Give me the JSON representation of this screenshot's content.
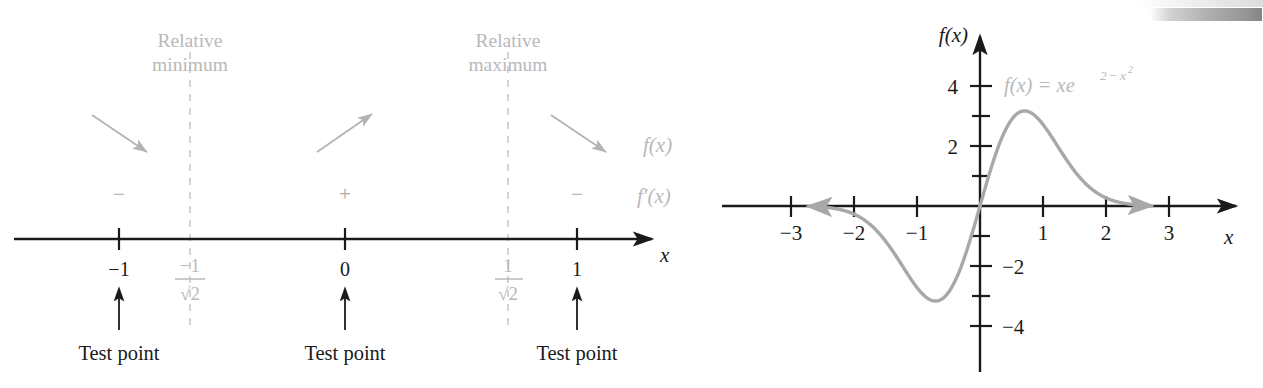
{
  "figure": {
    "kind": "calculus-textbook-figure",
    "panels": [
      "sign-chart-number-line",
      "function-graph"
    ]
  },
  "sign_chart": {
    "axis_label": "x",
    "row_labels": {
      "f": "f(x)",
      "fprime": "f′(x)"
    },
    "critical_labels": [
      {
        "id": "relative-minimum",
        "line1": "Relative",
        "line2": "minimum",
        "at": "-1/√2"
      },
      {
        "id": "relative-maximum",
        "line1": "Relative",
        "line2": "maximum",
        "at": "1/√2"
      }
    ],
    "ticks": [
      {
        "label": "−1",
        "kind": "test-point",
        "type": "plain"
      },
      {
        "label": "−1/√2",
        "numerator": "−1",
        "denominator": "√2",
        "kind": "critical",
        "type": "fraction"
      },
      {
        "label": "0",
        "kind": "test-point",
        "type": "plain"
      },
      {
        "label": "1/√2",
        "numerator": "1",
        "denominator": "√2",
        "kind": "critical",
        "type": "fraction"
      },
      {
        "label": "1",
        "kind": "test-point",
        "type": "plain"
      }
    ],
    "intervals": [
      {
        "sign": "−",
        "behavior": "decreasing",
        "arrow": "down-right"
      },
      {
        "sign": "+",
        "behavior": "increasing",
        "arrow": "up-right"
      },
      {
        "sign": "−",
        "behavior": "decreasing",
        "arrow": "down-right"
      }
    ],
    "test_point_caption": "Test point",
    "test_point_captions": [
      "Test point",
      "Test point",
      "Test point"
    ]
  },
  "graph": {
    "y_axis_label": "f(x)",
    "x_axis_label": "x",
    "equation": "f(x) = xe",
    "equation_exp_base": "2",
    "equation_exp_minus": "−",
    "equation_exp_var": "x",
    "equation_exp_pow": "2",
    "equation_plain": "f(x) = xe^(2−x²)",
    "x_tick_labels": [
      "−3",
      "−2",
      "−1",
      "1",
      "2",
      "3"
    ],
    "y_tick_labels": [
      "4",
      "2",
      "−2",
      "−4"
    ]
  },
  "colors": {
    "curve": "#a8a8a8",
    "gray_text": "#b9b9b9",
    "axis": "#1a1a1a",
    "dashed": "#c4c4c4"
  },
  "chart_data": {
    "type": "line",
    "title": "",
    "xlabel": "x",
    "ylabel": "f(x)",
    "xlim": [
      -3.4,
      3.4
    ],
    "ylim": [
      -5.2,
      4.6
    ],
    "grid": false,
    "legend": "none",
    "equation": "f(x) = x*e^(2 - x^2)",
    "x_ticks": [
      -3,
      -2,
      -1,
      1,
      2,
      3
    ],
    "y_ticks": [
      4,
      3,
      2,
      1,
      -1,
      -2,
      -3,
      -4
    ],
    "y_labeled_ticks": [
      4,
      2,
      -2,
      -4
    ],
    "annotations": [
      {
        "text": "f(x) = xe^(2−x²)",
        "x": 0.35,
        "y": 3.9
      }
    ],
    "critical_points": [
      {
        "x": -0.7071,
        "y": -3.0,
        "type": "relative minimum"
      },
      {
        "x": 0.7071,
        "y": 3.0,
        "type": "relative maximum"
      }
    ],
    "series": [
      {
        "name": "f(x) = xe^(2-x^2)",
        "x": [
          -3.0,
          -2.8,
          -2.6,
          -2.4,
          -2.2,
          -2.0,
          -1.8,
          -1.6,
          -1.4,
          -1.2,
          -1.0,
          -0.9,
          -0.8,
          -0.7071,
          -0.6,
          -0.5,
          -0.4,
          -0.3,
          -0.2,
          -0.1,
          0.0,
          0.1,
          0.2,
          0.3,
          0.4,
          0.5,
          0.6,
          0.7071,
          0.8,
          0.9,
          1.0,
          1.2,
          1.4,
          1.6,
          1.8,
          2.0,
          2.2,
          2.4,
          2.6,
          2.8,
          3.0
        ],
        "y": [
          -0.0027,
          -0.0076,
          -0.0202,
          -0.0503,
          -0.1175,
          -0.2707,
          -0.5674,
          -1.1162,
          -2.0461,
          -3.4754,
          -2.7183,
          -3.2543,
          -3.8098,
          -3.0,
          -4.4207,
          -4.1192,
          -3.7555,
          -3.0419,
          -2.1024,
          -1.0739,
          0.0,
          1.0739,
          2.1024,
          3.0419,
          3.7555,
          4.1192,
          4.4207,
          3.0,
          3.8098,
          3.2543,
          2.7183,
          3.4754,
          2.0461,
          1.1162,
          0.5674,
          0.2707,
          0.1175,
          0.0503,
          0.0202,
          0.0076,
          0.0027
        ]
      }
    ],
    "note": "Curve rises from near 0 at x=-3, dips to a relative minimum near (-0.707, -3.0), crosses the origin, peaks at a relative maximum near (0.707, 3.0), then decays toward 0."
  }
}
